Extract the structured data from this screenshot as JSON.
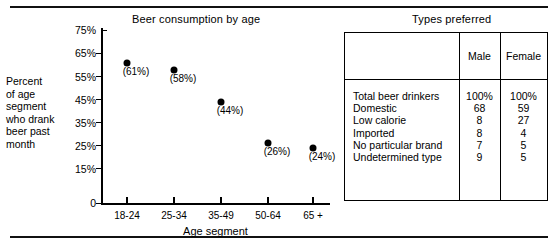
{
  "figure": {
    "chart_panel_title": "Beer consumption by age",
    "table_panel_title": "Types preferred"
  },
  "chart_data": {
    "type": "scatter",
    "title": "Beer consumption by age",
    "xlabel": "Age segment",
    "ylabel": "Percent\nof age\nsegment\nwho drank\nbeer past\nmonth",
    "categories": [
      "18-24",
      "25-34",
      "35-49",
      "50-64",
      "65 +"
    ],
    "values": [
      61,
      58,
      44,
      26,
      24
    ],
    "point_labels": [
      "(61%)",
      "(58%)",
      "(44%)",
      "(26%)",
      "(24%)"
    ],
    "ytick_labels": [
      "75%",
      "65%",
      "55%",
      "45%",
      "35%",
      "25%",
      "15%",
      "0"
    ],
    "ytick_values": [
      75,
      65,
      55,
      45,
      35,
      25,
      15,
      0
    ],
    "ylim": [
      0,
      75
    ],
    "grid": false,
    "legend": "none",
    "marker_color": "#000000"
  },
  "table_data": {
    "type": "table",
    "title": "Types preferred",
    "columns": [
      "",
      "Male",
      "Female"
    ],
    "rows": [
      {
        "label": "Total beer drinkers",
        "male": "100%",
        "female": "100%"
      },
      {
        "label": "Domestic",
        "male": "68",
        "female": "59"
      },
      {
        "label": "Low calorie",
        "male": "8",
        "female": "27"
      },
      {
        "label": "Imported",
        "male": "8",
        "female": "4"
      },
      {
        "label": "No particular brand",
        "male": "7",
        "female": "5"
      },
      {
        "label": "Undetermined type",
        "male": "9",
        "female": "5"
      }
    ]
  },
  "style": {
    "ink": "#000000",
    "paper": "#ffffff"
  }
}
